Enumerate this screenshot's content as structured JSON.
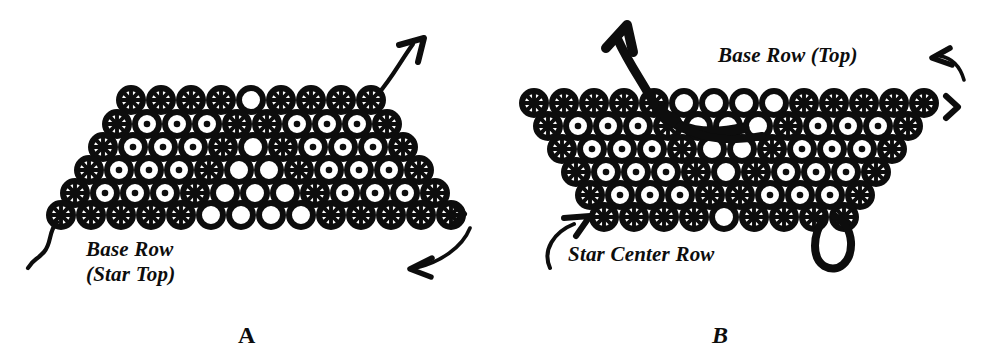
{
  "figure": {
    "background_color": "#ffffff",
    "ink_color": "#0d0d0d",
    "width": 988,
    "height": 363
  },
  "panel_a": {
    "label": "A",
    "caption_line1": "Base Row",
    "caption_line2": "(Star Top)",
    "annotations": {
      "thread_exit_arrow": "arrow-up-right",
      "thread_tail": "wavy-thread-tail-bottom-left",
      "chevron_mark": ">",
      "caption_arrow": "curved-arrow-pointing-left"
    },
    "bead_legend": {
      "star": "X-marked bead (star/cross center)",
      "dot": "bead with solid round center",
      "open": "open ring bead"
    },
    "grid": {
      "bead_diameter": 30,
      "row_pitch": 23,
      "col_pitch": 30,
      "rows": [
        {
          "y": 100,
          "x_start": 131,
          "beads": [
            "star",
            "star",
            "star",
            "star",
            "open",
            "star",
            "star",
            "star",
            "star"
          ]
        },
        {
          "y": 124,
          "x_start": 117,
          "beads": [
            "star",
            "dot",
            "dot",
            "dot",
            "star",
            "star",
            "dot",
            "dot",
            "dot",
            "star"
          ]
        },
        {
          "y": 147,
          "x_start": 103,
          "beads": [
            "star",
            "dot",
            "dot",
            "dot",
            "star",
            "open",
            "star",
            "dot",
            "dot",
            "dot",
            "star"
          ]
        },
        {
          "y": 170,
          "x_start": 89,
          "beads": [
            "star",
            "dot",
            "dot",
            "dot",
            "star",
            "open",
            "open",
            "star",
            "dot",
            "dot",
            "dot",
            "star"
          ]
        },
        {
          "y": 193,
          "x_start": 75,
          "beads": [
            "star",
            "dot",
            "dot",
            "dot",
            "star",
            "open",
            "open",
            "open",
            "star",
            "dot",
            "dot",
            "dot",
            "star"
          ]
        },
        {
          "y": 215,
          "x_start": 61,
          "beads": [
            "star",
            "star",
            "star",
            "star",
            "star",
            "open",
            "open",
            "open",
            "open",
            "star",
            "star",
            "star",
            "star",
            "star"
          ]
        }
      ]
    }
  },
  "panel_b": {
    "label": "B",
    "caption_top": "Base Row (Top)",
    "caption_bottom": "Star Center Row",
    "annotations": {
      "thread_exit_arrow": "thick-arrow-up-left",
      "chevron_mark": ">",
      "caption_top_arrow": "curved-arrow-pointing-left",
      "caption_bottom_arrow": "curved-arrow-pointing-up-right",
      "thread_loop": "thread-loop-bottom-right",
      "working_thread": "thick-thread-through-second-row"
    },
    "bead_legend": {
      "star": "X-marked bead (star/cross center)",
      "dot": "bead with solid round center",
      "open": "open ring bead"
    },
    "grid": {
      "bead_diameter": 30,
      "row_pitch": 23,
      "col_pitch": 30,
      "rows": [
        {
          "y": 103,
          "x_start": 40,
          "beads": [
            "star",
            "star",
            "star",
            "star",
            "star",
            "open",
            "open",
            "open",
            "open",
            "star",
            "star",
            "star",
            "star",
            "star"
          ]
        },
        {
          "y": 126,
          "x_start": 54,
          "beads": [
            "star",
            "dot",
            "dot",
            "dot",
            "star",
            "open",
            "open",
            "open",
            "star",
            "dot",
            "dot",
            "dot",
            "star"
          ]
        },
        {
          "y": 149,
          "x_start": 68,
          "beads": [
            "star",
            "dot",
            "dot",
            "dot",
            "star",
            "open",
            "open",
            "star",
            "dot",
            "dot",
            "dot",
            "star"
          ]
        },
        {
          "y": 172,
          "x_start": 82,
          "beads": [
            "star",
            "dot",
            "dot",
            "dot",
            "star",
            "open",
            "star",
            "dot",
            "dot",
            "dot",
            "star"
          ]
        },
        {
          "y": 195,
          "x_start": 96,
          "beads": [
            "star",
            "dot",
            "dot",
            "dot",
            "star",
            "star",
            "dot",
            "dot",
            "dot",
            "star"
          ]
        },
        {
          "y": 217,
          "x_start": 110,
          "beads": [
            "star",
            "star",
            "star",
            "star",
            "open",
            "star",
            "star",
            "star",
            "star"
          ]
        }
      ]
    }
  }
}
